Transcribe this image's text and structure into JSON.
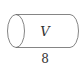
{
  "diagram": {
    "shape": "cylinder",
    "orientation": "horizontal",
    "volume_label": "V",
    "length_label": "8",
    "stroke_color": "#555555",
    "text_color": "#333333",
    "background": "#ffffff"
  }
}
